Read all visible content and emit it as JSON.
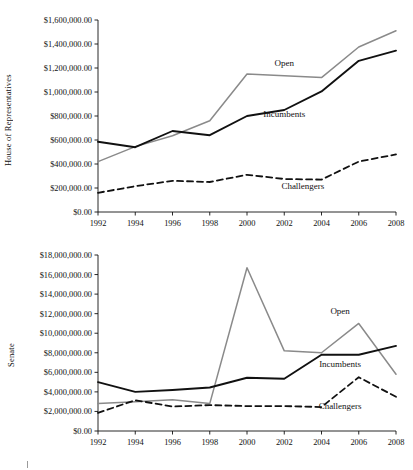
{
  "figure": {
    "background": "#ffffff",
    "series_colors": {
      "open": "#8a8a8a",
      "incumbents": "#111111",
      "challengers": "#111111"
    }
  },
  "panels": [
    {
      "id": "house",
      "axis_title": "House of Representatives",
      "series_labels": {
        "open": "Open",
        "incumbents": "Incumbents",
        "challengers": "Challengers"
      },
      "ytick_labels": [
        "$0.00",
        "$200,000.00",
        "$400,000.00",
        "$600,000.00",
        "$800,000.00",
        "$1,000,000.00",
        "$1,200,000.00",
        "$1,400,000.00",
        "$1,600,000.00"
      ],
      "xtick_labels": [
        "1992",
        "1994",
        "1996",
        "1998",
        "2000",
        "2002",
        "2004",
        "2006",
        "2008"
      ]
    },
    {
      "id": "senate",
      "axis_title": "Senate",
      "series_labels": {
        "open": "Open",
        "incumbents": "Incumbents",
        "challengers": "Challengers"
      },
      "ytick_labels": [
        "$0.00",
        "$2,000,000.00",
        "$4,000,000.00",
        "$6,000,000.00",
        "$8,000,000.00",
        "$10,000,000.00",
        "$12,000,000.00",
        "$14,000,000.00",
        "$16,000,000.00",
        "$18,000,000.00"
      ],
      "xtick_labels": [
        "1992",
        "1994",
        "1996",
        "1998",
        "2000",
        "2002",
        "2004",
        "2006",
        "2008"
      ]
    }
  ],
  "chart_data": [
    {
      "type": "line",
      "title": "",
      "xlabel": "",
      "ylabel": "House of Representatives",
      "x": [
        1992,
        1994,
        1996,
        1998,
        2000,
        2002,
        2004,
        2006,
        2008
      ],
      "xlim": [
        1992,
        2008
      ],
      "ylim": [
        0,
        1600000
      ],
      "yticks": [
        0,
        200000,
        400000,
        600000,
        800000,
        1000000,
        1200000,
        1400000,
        1600000
      ],
      "grid": false,
      "legend": "inline-annotations",
      "series": [
        {
          "name": "Open",
          "style": "solid",
          "color": "#8a8a8a",
          "values": [
            420000,
            545000,
            635000,
            760000,
            1150000,
            1135000,
            1120000,
            1375000,
            1510000
          ]
        },
        {
          "name": "Incumbents",
          "style": "solid",
          "color": "#111111",
          "values": [
            585000,
            540000,
            675000,
            640000,
            800000,
            850000,
            1005000,
            1260000,
            1345000
          ]
        },
        {
          "name": "Challengers",
          "style": "dashed",
          "color": "#111111",
          "values": [
            160000,
            215000,
            260000,
            250000,
            310000,
            275000,
            270000,
            420000,
            480000
          ]
        }
      ],
      "annotations": [
        {
          "text": "Open",
          "near_x": 2002,
          "near_y": 1215000
        },
        {
          "text": "Incumbents",
          "near_x": 2002,
          "near_y": 790000
        },
        {
          "text": "Challengers",
          "near_x": 2003,
          "near_y": 195000
        }
      ]
    },
    {
      "type": "line",
      "title": "",
      "xlabel": "",
      "ylabel": "Senate",
      "x": [
        1992,
        1994,
        1996,
        1998,
        2000,
        2002,
        2004,
        2006,
        2008
      ],
      "xlim": [
        1992,
        2008
      ],
      "ylim": [
        0,
        18000000
      ],
      "yticks": [
        0,
        2000000,
        4000000,
        6000000,
        8000000,
        10000000,
        12000000,
        14000000,
        16000000,
        18000000
      ],
      "grid": false,
      "legend": "inline-annotations",
      "series": [
        {
          "name": "Open",
          "style": "solid",
          "color": "#8a8a8a",
          "values": [
            2800000,
            3000000,
            3200000,
            2800000,
            16700000,
            8200000,
            8000000,
            11000000,
            5800000
          ]
        },
        {
          "name": "Incumbents",
          "style": "solid",
          "color": "#111111",
          "values": [
            5000000,
            4000000,
            4200000,
            4450000,
            5450000,
            5350000,
            7800000,
            7800000,
            8700000
          ]
        },
        {
          "name": "Challengers",
          "style": "dashed",
          "color": "#111111",
          "values": [
            1850000,
            3150000,
            2500000,
            2650000,
            2550000,
            2550000,
            2450000,
            5500000,
            3500000
          ]
        }
      ],
      "annotations": [
        {
          "text": "Open",
          "near_x": 2005,
          "near_y": 12000000
        },
        {
          "text": "Incumbents",
          "near_x": 2005,
          "near_y": 6500000
        },
        {
          "text": "Challengers",
          "near_x": 2005,
          "near_y": 2300000
        }
      ]
    }
  ]
}
